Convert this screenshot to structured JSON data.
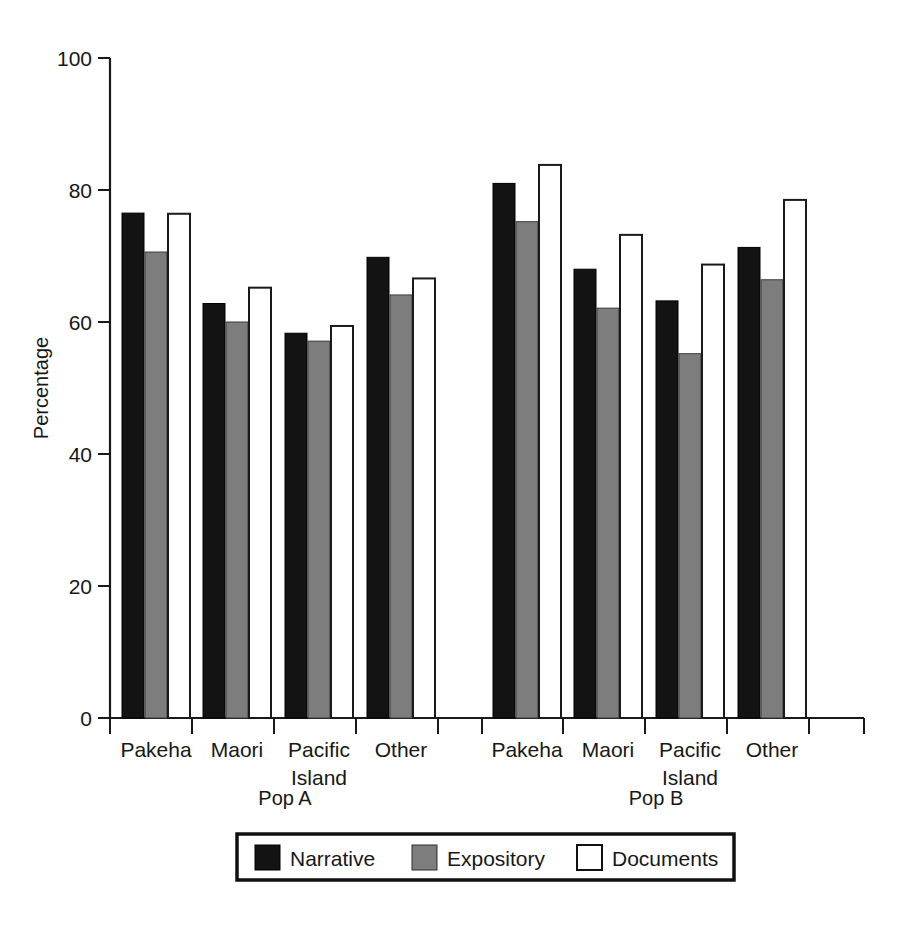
{
  "chart_data": {
    "type": "bar",
    "title": "",
    "xlabel": "",
    "ylabel": "Percentage",
    "ylim": [
      0,
      100
    ],
    "yticks": [
      0,
      20,
      40,
      60,
      80,
      100
    ],
    "ytick_labels": [
      "0",
      "20",
      "40",
      "60",
      "80",
      "100"
    ],
    "grid": false,
    "legend_position": "bottom",
    "categories": [
      "Pakeha",
      "Maori",
      "Pacific Island",
      "Other",
      "Pakeha",
      "Maori",
      "Pacific Island",
      "Other"
    ],
    "category_lines": [
      [
        "Pakeha"
      ],
      [
        "Maori"
      ],
      [
        "Pacific",
        "Island"
      ],
      [
        "Other"
      ],
      [
        "Pakeha"
      ],
      [
        "Maori"
      ],
      [
        "Pacific",
        "Island"
      ],
      [
        "Other"
      ]
    ],
    "groups": [
      {
        "label": "Pop A",
        "categories": [
          "Pakeha",
          "Maori",
          "Pacific Island",
          "Other"
        ]
      },
      {
        "label": "Pop B",
        "categories": [
          "Pakeha",
          "Maori",
          "Pacific Island",
          "Other"
        ]
      }
    ],
    "series": [
      {
        "name": "Narrative",
        "color": "#131313",
        "values": [
          76.5,
          62.8,
          58.3,
          69.8,
          81.0,
          68.0,
          63.2,
          71.3
        ]
      },
      {
        "name": "Expository",
        "color": "#7d7d7d",
        "values": [
          70.6,
          60.0,
          57.1,
          64.1,
          75.2,
          62.1,
          55.2,
          66.4
        ]
      },
      {
        "name": "Documents",
        "color": "#ffffff",
        "values": [
          76.4,
          65.2,
          59.4,
          66.6,
          83.8,
          73.2,
          68.7,
          78.5
        ]
      }
    ]
  },
  "legend": {
    "entries": [
      {
        "label": "Narrative",
        "swatch": "solid-black-swatch"
      },
      {
        "label": "Expository",
        "swatch": "solid-gray-swatch"
      },
      {
        "label": "Documents",
        "swatch": "outline-white-swatch"
      }
    ]
  },
  "axes": {
    "y_title": "Percentage"
  },
  "caption": {
    "text": ""
  }
}
